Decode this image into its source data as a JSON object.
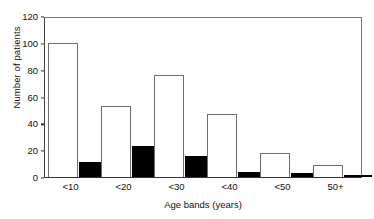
{
  "chart_data": {
    "type": "bar",
    "title": "",
    "xlabel": "Age bands (years)",
    "ylabel": "Number of patients",
    "categories": [
      "<10",
      "<20",
      "<30",
      "<40",
      "<50",
      "50+"
    ],
    "series": [
      {
        "name": "open",
        "color": "#ffffff",
        "values": [
          100,
          53,
          76,
          47,
          18,
          9
        ]
      },
      {
        "name": "solid",
        "color": "#000000",
        "values": [
          11,
          23,
          16,
          4,
          3,
          1
        ]
      }
    ],
    "ylim": [
      0,
      120
    ],
    "ytick_labels": [
      "0",
      "20",
      "40",
      "60",
      "80",
      "100",
      "120"
    ],
    "ytick_values": [
      0,
      20,
      40,
      60,
      80,
      100,
      120
    ],
    "grid": false,
    "legend": "none"
  }
}
